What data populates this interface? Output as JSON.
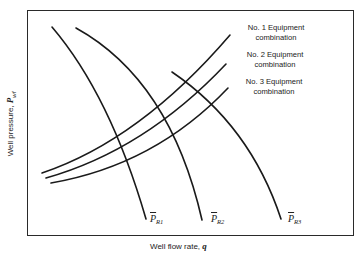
{
  "figure": {
    "xlabel_text": "Well flow rate, ",
    "xlabel_var": "q",
    "ylabel_text": "Well pressure, ",
    "ylabel_var": "P",
    "ylabel_sub": "wf"
  },
  "legend": [
    {
      "line1": "No. 1 Equipment",
      "line2": "combination"
    },
    {
      "line1": "No. 2 Equipment",
      "line2": "combination"
    },
    {
      "line1": "No. 3 Equipment",
      "line2": "combination"
    }
  ],
  "reservoir_curves": [
    {
      "symbol": "P",
      "sub": "R1"
    },
    {
      "symbol": "P",
      "sub": "R2"
    },
    {
      "symbol": "P",
      "sub": "R3"
    }
  ],
  "colors": {
    "line": "#1a1a1a",
    "frame": "#2a2a2a",
    "background": "#ffffff"
  }
}
